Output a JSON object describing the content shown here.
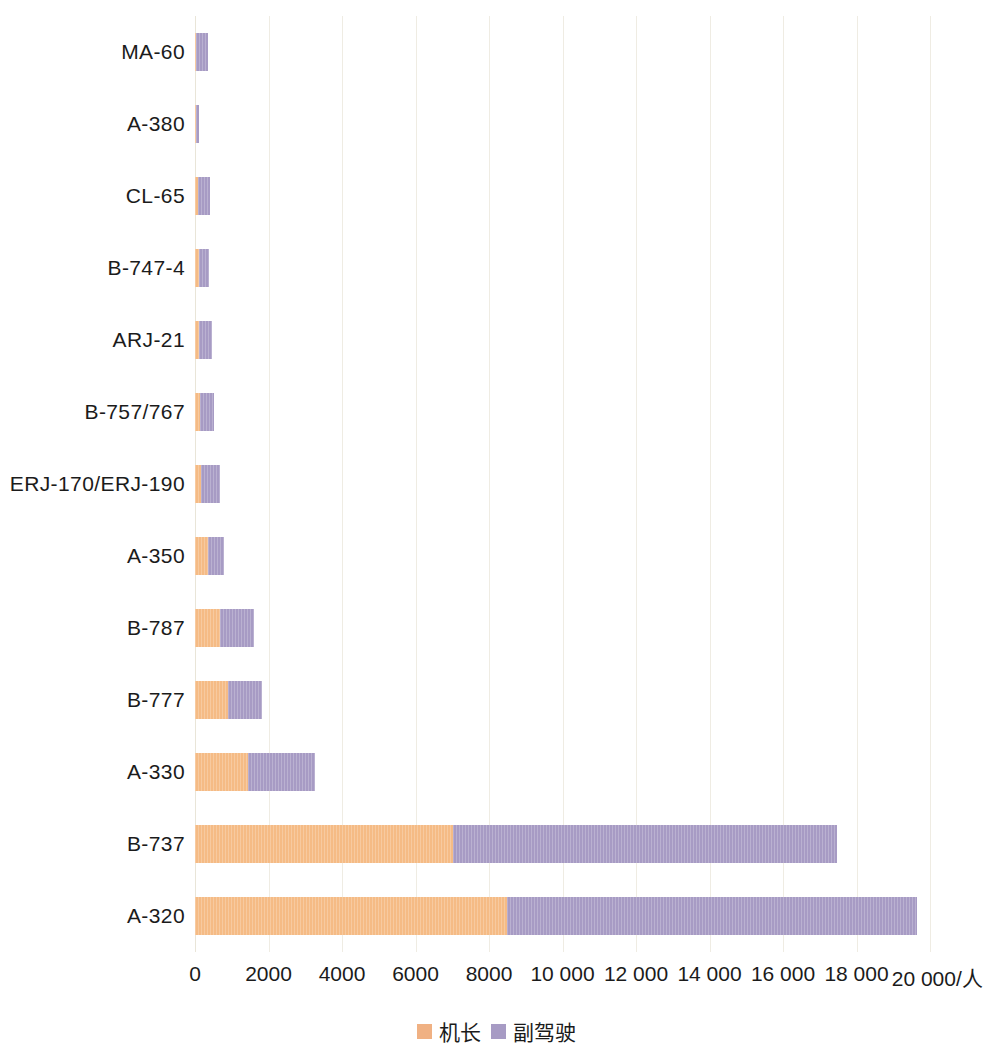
{
  "chart_data": {
    "type": "bar",
    "orientation": "horizontal",
    "stacked": true,
    "title": "",
    "xlabel": "",
    "ylabel": "",
    "xlim": [
      0,
      20000
    ],
    "grid": true,
    "legend_position": "bottom",
    "unit_suffix": "/人",
    "categories": [
      "MA-60",
      "A-380",
      "CL-65",
      "B-747-4",
      "ARJ-21",
      "B-757/767",
      "ERJ-170/ERJ-190",
      "A-350",
      "B-787",
      "B-777",
      "A-330",
      "B-737",
      "A-320"
    ],
    "series": [
      {
        "name": "机长",
        "color": "#f5bb85",
        "values": [
          20,
          40,
          80,
          100,
          110,
          135,
          160,
          355,
          680,
          900,
          1440,
          7020,
          8490
        ]
      },
      {
        "name": "副驾驶",
        "color": "#a79bc4",
        "values": [
          335,
          70,
          320,
          280,
          355,
          385,
          520,
          435,
          920,
          920,
          1825,
          10450,
          11155
        ]
      }
    ],
    "totals": [
      355,
      110,
      400,
      380,
      465,
      520,
      680,
      790,
      1600,
      1820,
      3265,
      17470,
      19645
    ],
    "xticks": [
      {
        "value": 0,
        "label": "0"
      },
      {
        "value": 2000,
        "label": "2000"
      },
      {
        "value": 4000,
        "label": "4000"
      },
      {
        "value": 6000,
        "label": "6000"
      },
      {
        "value": 8000,
        "label": "8000"
      },
      {
        "value": 10000,
        "label": "10 000"
      },
      {
        "value": 12000,
        "label": "12 000"
      },
      {
        "value": 14000,
        "label": "14 000"
      },
      {
        "value": 16000,
        "label": "16 000"
      },
      {
        "value": 18000,
        "label": "18 000"
      },
      {
        "value": 20000,
        "label": "20 000/人"
      }
    ],
    "legend": [
      {
        "label": "机长",
        "color": "#f5bb85"
      },
      {
        "label": "副驾驶",
        "color": "#a79bc4"
      }
    ],
    "colors": {
      "captain": "#f5bb85",
      "first_officer": "#a79bc4",
      "gridline": "#efece3",
      "text": "#1b1b1b",
      "background": "#ffffff"
    }
  }
}
